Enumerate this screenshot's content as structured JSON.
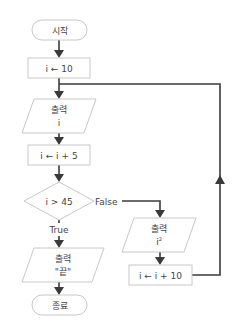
{
  "diagram": {
    "type": "flowchart",
    "colors": {
      "line": "#3a3a3a",
      "shape_border": "#c8c8c8",
      "shape_fill": "#ffffff",
      "text": "#444444"
    },
    "nodes": {
      "start": {
        "kind": "terminal",
        "label": "시작"
      },
      "init": {
        "kind": "process",
        "label": "i ← 10"
      },
      "output_i": {
        "kind": "io",
        "line1": "출력",
        "line2": "i"
      },
      "add5": {
        "kind": "process",
        "label": "i ← i + 5"
      },
      "decision": {
        "kind": "decision",
        "label": "i > 45"
      },
      "output_end": {
        "kind": "io",
        "line1": "출력",
        "line2": "\"끝\""
      },
      "end": {
        "kind": "terminal",
        "label": "종료"
      },
      "output_sq": {
        "kind": "io",
        "line1": "출력",
        "line2_base": "i",
        "line2_sup": "2"
      },
      "add10": {
        "kind": "process",
        "label": "i ← i + 10"
      }
    },
    "edges": {
      "true_label": "True",
      "false_label": "False"
    }
  }
}
